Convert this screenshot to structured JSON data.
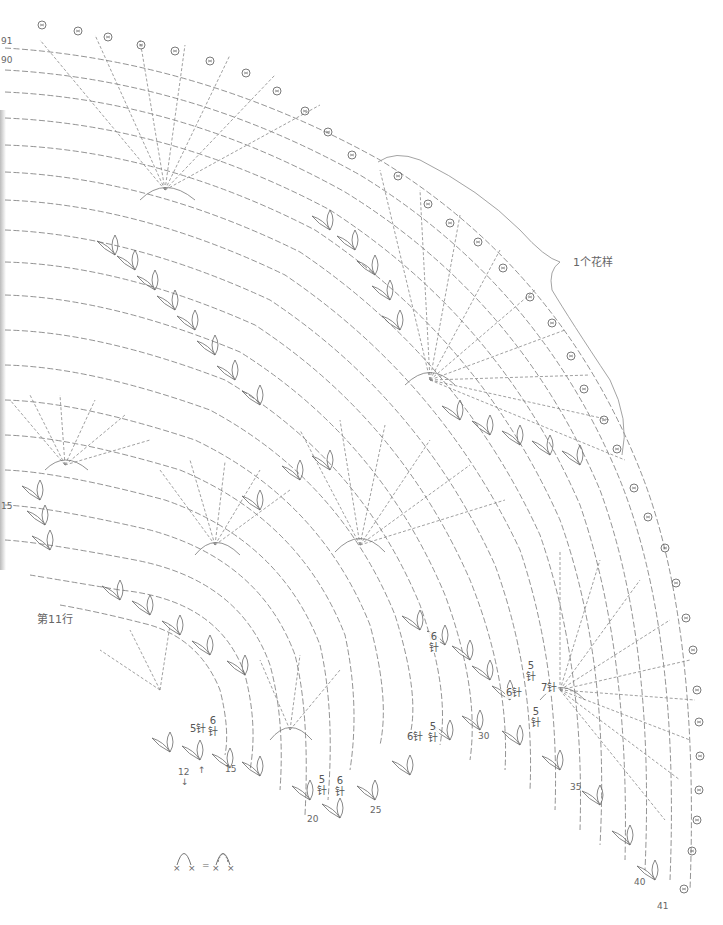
{
  "diagram": {
    "type": "crochet-chart",
    "colors": {
      "line": "#6a6a6a",
      "background": "#ffffff",
      "text": "#555555"
    },
    "pattern_repeat_label": "1个花样",
    "row_label_11": "第11行",
    "edge_row_numbers": {
      "r91": "91",
      "r90": "90",
      "r15_left": "15",
      "r12": "12",
      "r15": "15",
      "r20": "20",
      "r25": "25",
      "r30": "30",
      "r35": "35",
      "r40": "40",
      "r41": "41"
    },
    "stitch_count_labels": [
      {
        "id": "a",
        "num": "5",
        "unit": "针",
        "inline": true
      },
      {
        "id": "b",
        "num": "6",
        "unit": "针"
      },
      {
        "id": "c",
        "num": "5",
        "unit": "针"
      },
      {
        "id": "d",
        "num": "6",
        "unit": "针"
      },
      {
        "id": "e",
        "num": "6",
        "unit": "针"
      },
      {
        "id": "f",
        "num": "5",
        "unit": "针"
      },
      {
        "id": "g",
        "num": "6",
        "unit": "针",
        "inline": true
      },
      {
        "id": "h",
        "num": "5",
        "unit": "针"
      },
      {
        "id": "i",
        "num": "6",
        "unit": "针",
        "inline": true
      },
      {
        "id": "j",
        "num": "7",
        "unit": "针",
        "inline": true
      },
      {
        "id": "k",
        "num": "5",
        "unit": "针"
      }
    ],
    "legend": {
      "lhs_symbol": "chain-arc-between-sc",
      "equals": "=",
      "rhs_symbol": "chain-loops-between-sc",
      "x_mark": "×"
    },
    "arrows": {
      "down": "↓",
      "up": "↑"
    }
  }
}
